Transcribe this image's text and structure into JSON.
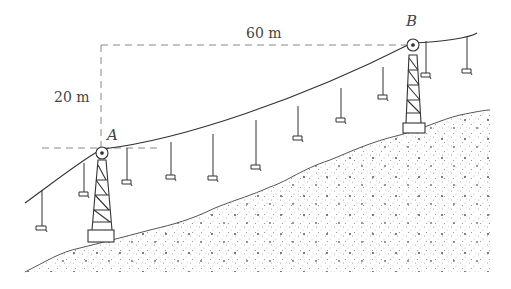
{
  "figure": {
    "type": "ski lift / chairlift cable diagram",
    "dimensions": {
      "horizontal_label": "60 m",
      "vertical_label": "20 m"
    },
    "points": {
      "A": "A",
      "B": "B"
    },
    "elements": [
      "cable",
      "tower-A",
      "tower-B",
      "chairs",
      "hillside"
    ]
  },
  "colors": {
    "line": "#333333",
    "dashed": "#888888",
    "ground_dots": "#777777"
  }
}
